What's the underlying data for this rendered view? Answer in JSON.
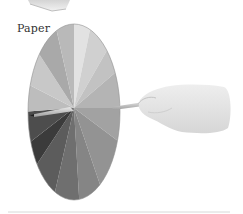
{
  "figure": {
    "caption": "Paper",
    "colors": {
      "background": "#ffffff",
      "caption_text": "#333333",
      "segments": [
        "#d9d9d9",
        "#e6e6e6",
        "#cfcfcf",
        "#bdbdbd",
        "#a8a8a8",
        "#9a9a9a",
        "#8a8a8a",
        "#7a7a7a",
        "#6a6a6a",
        "#555555",
        "#3c3c3c",
        "#4a4a4a",
        "#b0b0b0",
        "#c4c4c4",
        "#cccccc",
        "#b8b8b8"
      ],
      "pencil": "#c8c8c8",
      "hand": "#e4e4e4"
    }
  }
}
